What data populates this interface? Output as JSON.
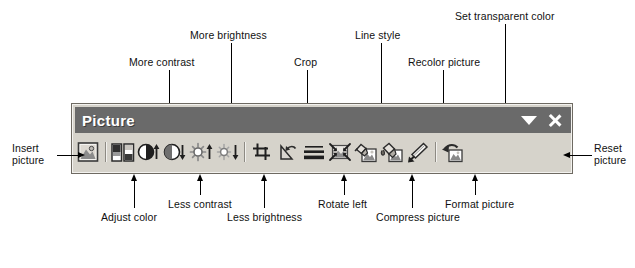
{
  "toolbar": {
    "title": "Picture",
    "controls": [
      {
        "name": "toolbar-options-dropdown",
        "icon": "chevron-down-icon"
      },
      {
        "name": "close-button",
        "icon": "close-icon"
      }
    ],
    "buttons": [
      {
        "id": "insert-picture",
        "icon": "insert-picture-icon",
        "label": "Insert picture"
      },
      {
        "id": "color",
        "icon": "adjust-color-icon",
        "label": "Adjust color"
      },
      {
        "id": "more-contrast",
        "icon": "more-contrast-icon",
        "label": "More contrast"
      },
      {
        "id": "less-contrast",
        "icon": "less-contrast-icon",
        "label": "Less contrast"
      },
      {
        "id": "more-brightness",
        "icon": "more-brightness-icon",
        "label": "More brightness"
      },
      {
        "id": "less-brightness",
        "icon": "less-brightness-icon",
        "label": "Less brightness"
      },
      {
        "id": "crop",
        "icon": "crop-icon",
        "label": "Crop"
      },
      {
        "id": "rotate-left",
        "icon": "rotate-left-icon",
        "label": "Rotate left"
      },
      {
        "id": "line-style",
        "icon": "line-style-icon",
        "label": "Line style"
      },
      {
        "id": "compress-picture",
        "icon": "compress-picture-icon",
        "label": "Compress picture"
      },
      {
        "id": "recolor-picture",
        "icon": "recolor-picture-icon",
        "label": "Recolor picture"
      },
      {
        "id": "format-picture",
        "icon": "format-picture-icon",
        "label": "Format picture"
      },
      {
        "id": "set-transparent-color",
        "icon": "set-transparent-color-icon",
        "label": "Set transparent color"
      },
      {
        "id": "reset-picture",
        "icon": "reset-picture-icon",
        "label": "Reset picture"
      }
    ]
  },
  "callouts": {
    "insert_picture": "Insert\npicture",
    "insert_picture_line1": "Insert",
    "insert_picture_line2": "picture",
    "more_contrast": "More contrast",
    "more_brightness": "More brightness",
    "crop": "Crop",
    "line_style": "Line style",
    "recolor_picture": "Recolor picture",
    "set_transparent_color": "Set transparent color",
    "reset_picture_line1": "Reset",
    "reset_picture_line2": "picture",
    "adjust_color": "Adjust color",
    "less_contrast": "Less contrast",
    "less_brightness": "Less brightness",
    "rotate_left": "Rotate left",
    "compress_picture": "Compress picture",
    "format_picture": "Format picture"
  },
  "colors": {
    "page_background": "#ffffff",
    "toolbar_face": "#d6d3cb",
    "toolbar_border": "#6e6a62",
    "titlebar": "#6a6a6a",
    "title_text": "#ffffff",
    "leader_line": "#000000",
    "leader_line_over_titlebar": "#ffffff",
    "label_text": "#111111"
  }
}
